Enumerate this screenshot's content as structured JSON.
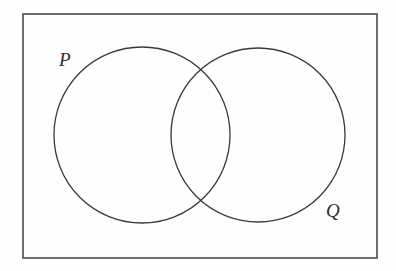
{
  "figure": {
    "name": "venn-diagram-two-sets",
    "kind": "venn-diagram",
    "background_color": "#fefefe",
    "stroke_color": "#3a3a3a",
    "universe_border_color": "#4a4a4a",
    "universe": {
      "name": "universal-set-rectangle",
      "x": 23,
      "y": 14,
      "width": 354,
      "height": 244,
      "stroke_width": 1.6
    },
    "sets": [
      {
        "id": "set-p",
        "label": "P",
        "cx": 142,
        "cy": 135,
        "r": 88,
        "stroke_width": 1.3,
        "label_x": 59,
        "label_y": 50
      },
      {
        "id": "set-q",
        "label": "Q",
        "cx": 258,
        "cy": 135,
        "r": 87,
        "stroke_width": 1.3,
        "label_x": 326,
        "label_y": 201
      }
    ],
    "intersection_points": [
      {
        "x": 201,
        "y": 70
      },
      {
        "x": 201,
        "y": 199
      }
    ]
  }
}
